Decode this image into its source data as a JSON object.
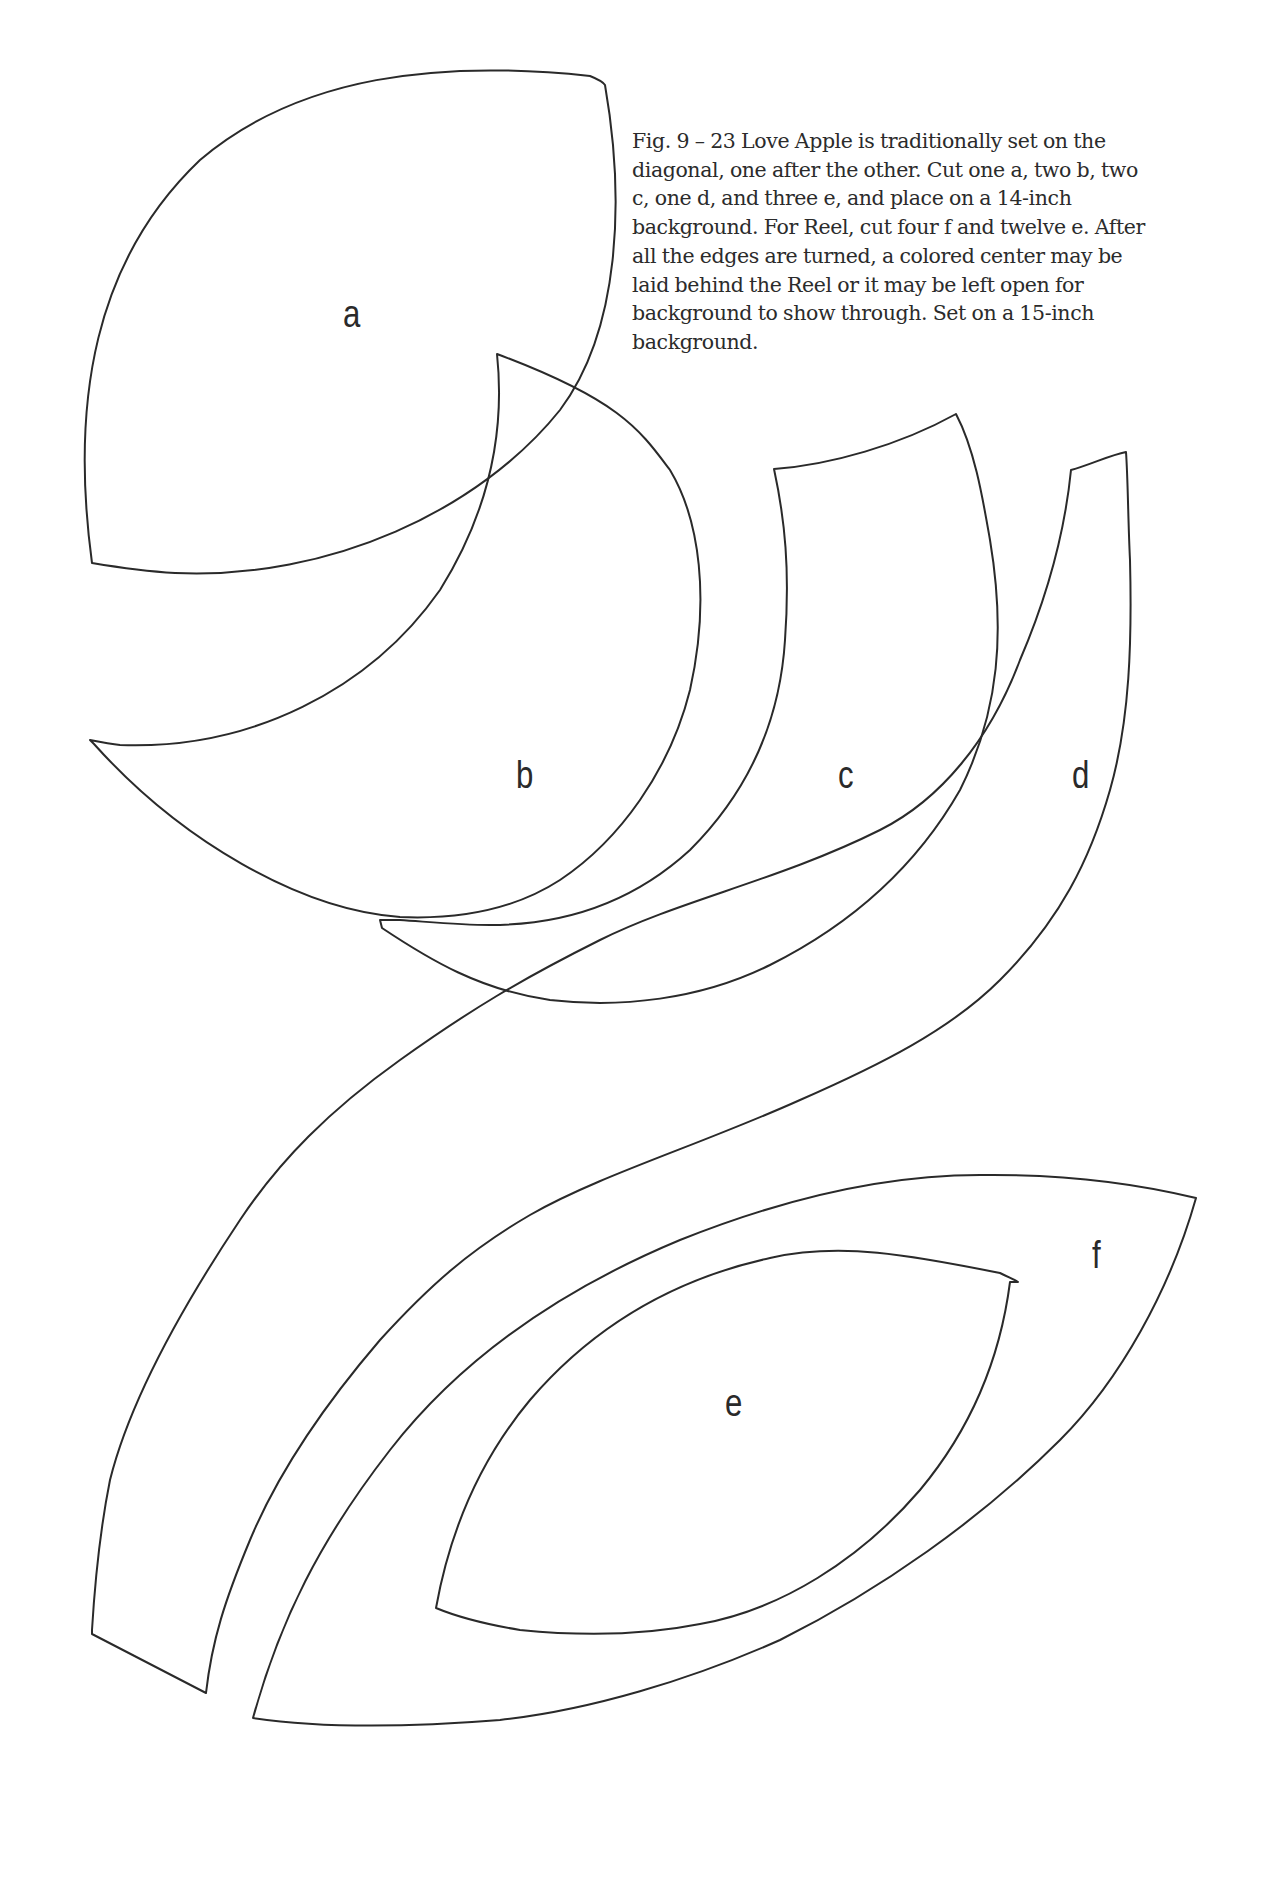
{
  "figure": {
    "caption_lines": [
      "Fig. 9 – 23 Love Apple is traditionally set on the",
      "diagonal, one after the other. Cut one a, two b, two",
      "c, one d, and three e, and place on a 14-inch",
      "background. For Reel, cut four f and twelve e. After",
      "all the edges are turned, a colored center may be",
      "laid behind the Reel or it may be left open for",
      "background to show through. Set on a 15-inch",
      "background."
    ],
    "pattern_pieces": [
      {
        "id": "a",
        "label": "a"
      },
      {
        "id": "b",
        "label": "b"
      },
      {
        "id": "c",
        "label": "c"
      },
      {
        "id": "d",
        "label": "d"
      },
      {
        "id": "e",
        "label": "e"
      },
      {
        "id": "f",
        "label": "f"
      }
    ],
    "stroke_color": "#2a2a2a",
    "background_color": "#ffffff"
  }
}
